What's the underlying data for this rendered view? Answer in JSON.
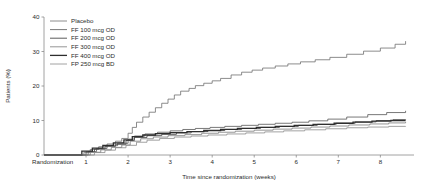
{
  "chart_data": {
    "type": "line",
    "title": "",
    "subtitle": "",
    "xlabel": "Time since randomization (weeks)",
    "ylabel": "Patients (%)",
    "xlim": [
      0,
      8.8
    ],
    "ylim": [
      0,
      40
    ],
    "grid": false,
    "legend_position": "top-left",
    "x_origin_label": "Randomization",
    "xticks": [
      1,
      2,
      3,
      4,
      5,
      6,
      7,
      8
    ],
    "xtick_labels": [
      "1",
      "2",
      "3",
      "4",
      "5",
      "6",
      "7",
      "8"
    ],
    "yticks": [
      0,
      10,
      20,
      30,
      40
    ],
    "ytick_labels": [
      "0",
      "10",
      "20",
      "30",
      "40"
    ],
    "step_type": "post",
    "series": [
      {
        "name": "Placebo",
        "color": "#6e6e6e",
        "width": 0.8,
        "final_value": 33.0,
        "x": [
          0,
          0.95,
          1.1,
          1.3,
          1.5,
          1.7,
          1.85,
          2.0,
          2.1,
          2.2,
          2.35,
          2.5,
          2.65,
          2.8,
          2.95,
          3.1,
          3.25,
          3.45,
          3.6,
          3.8,
          4.0,
          4.2,
          4.45,
          4.7,
          4.95,
          5.2,
          5.5,
          5.8,
          6.1,
          6.45,
          6.8,
          7.2,
          7.6,
          8.0,
          8.35,
          8.6
        ],
        "y": [
          0,
          0.8,
          1.6,
          2.4,
          3.2,
          4.0,
          4.8,
          6.3,
          8.0,
          9.5,
          11.0,
          12.4,
          13.7,
          15.0,
          16.2,
          17.4,
          18.5,
          19.3,
          20.1,
          20.8,
          21.5,
          22.2,
          23.2,
          24.0,
          24.6,
          25.2,
          25.8,
          26.4,
          27.0,
          27.6,
          28.3,
          29.2,
          30.1,
          31.0,
          32.1,
          33.0
        ]
      },
      {
        "name": "FF 100 mcg OD",
        "color": "#555555",
        "width": 0.8,
        "final_value": 12.8,
        "x": [
          0,
          1.05,
          1.25,
          1.5,
          1.75,
          2.0,
          2.15,
          2.4,
          2.7,
          3.0,
          3.3,
          3.6,
          3.95,
          4.3,
          4.7,
          5.1,
          5.5,
          5.9,
          6.3,
          6.75,
          7.2,
          7.7,
          8.15,
          8.6
        ],
        "y": [
          0,
          1.0,
          1.9,
          2.7,
          3.4,
          4.6,
          5.5,
          6.1,
          6.6,
          7.0,
          7.4,
          7.7,
          8.0,
          8.3,
          8.6,
          8.9,
          9.2,
          9.5,
          9.9,
          10.4,
          11.0,
          11.7,
          12.3,
          12.8
        ]
      },
      {
        "name": "FF 200 mcg OD",
        "color": "#4a4a4a",
        "width": 0.9,
        "final_value": 10.3,
        "x": [
          0,
          1.0,
          1.2,
          1.45,
          1.7,
          1.95,
          2.15,
          2.45,
          2.8,
          3.15,
          3.5,
          3.9,
          4.3,
          4.7,
          5.15,
          5.6,
          6.05,
          6.5,
          6.95,
          7.4,
          7.9,
          8.3,
          8.6
        ],
        "y": [
          0,
          0.9,
          1.7,
          2.5,
          3.1,
          4.2,
          5.1,
          5.6,
          6.0,
          6.4,
          6.8,
          7.1,
          7.4,
          7.7,
          8.0,
          8.3,
          8.6,
          8.9,
          9.2,
          9.6,
          10.0,
          10.2,
          10.3
        ]
      },
      {
        "name": "FF 300 mcg OD",
        "color": "#7a7a7a",
        "width": 0.8,
        "final_value": 9.6,
        "x": [
          0,
          1.1,
          1.35,
          1.6,
          1.85,
          2.05,
          2.3,
          2.6,
          2.95,
          3.35,
          3.75,
          4.15,
          4.55,
          5.0,
          5.45,
          5.9,
          6.35,
          6.8,
          7.25,
          7.75,
          8.2,
          8.6
        ],
        "y": [
          0,
          0.8,
          1.5,
          2.2,
          2.9,
          4.0,
          4.7,
          5.2,
          5.6,
          5.9,
          6.3,
          6.6,
          6.9,
          7.2,
          7.5,
          7.8,
          8.1,
          8.4,
          8.7,
          9.0,
          9.3,
          9.6
        ]
      },
      {
        "name": "FF 400 mcg OD",
        "color": "#2e2e2e",
        "width": 1.3,
        "final_value": 10.0,
        "x": [
          0,
          0.9,
          1.15,
          1.4,
          1.65,
          1.9,
          2.1,
          2.35,
          2.65,
          3.0,
          3.4,
          3.8,
          4.2,
          4.6,
          5.05,
          5.5,
          5.95,
          6.4,
          6.9,
          7.35,
          7.8,
          8.25,
          8.6
        ],
        "y": [
          0,
          1.1,
          2.0,
          2.8,
          3.5,
          4.4,
          5.3,
          5.8,
          6.2,
          6.5,
          6.8,
          7.1,
          7.4,
          7.7,
          8.0,
          8.3,
          8.6,
          8.9,
          9.2,
          9.5,
          9.8,
          10.0,
          10.0
        ]
      },
      {
        "name": "FP 250 mcg BD",
        "color": "#8a8a8a",
        "width": 0.8,
        "final_value": 8.4,
        "x": [
          0,
          1.2,
          1.45,
          1.7,
          1.95,
          2.2,
          2.45,
          2.75,
          3.1,
          3.5,
          3.9,
          4.35,
          4.8,
          5.25,
          5.7,
          6.2,
          6.7,
          7.2,
          7.7,
          8.2,
          8.6
        ],
        "y": [
          0,
          0.7,
          1.4,
          2.1,
          2.8,
          3.7,
          4.3,
          4.8,
          5.2,
          5.5,
          5.8,
          6.1,
          6.4,
          6.7,
          7.0,
          7.3,
          7.6,
          7.9,
          8.1,
          8.3,
          8.4
        ]
      }
    ]
  },
  "axes": {
    "ylabel": "Patients (%)",
    "xlabel": "Time since randomization (weeks)",
    "origin_label": "Randomization",
    "ytick_labels": [
      "0",
      "10",
      "20",
      "30",
      "40"
    ],
    "xtick_labels": [
      "1",
      "2",
      "3",
      "4",
      "5",
      "6",
      "7",
      "8"
    ]
  },
  "legend": {
    "items": [
      {
        "label": "Placebo"
      },
      {
        "label": "FF 100 mcg OD"
      },
      {
        "label": "FF 200 mcg OD"
      },
      {
        "label": "FF 300 mcg OD"
      },
      {
        "label": "FF 400 mcg OD"
      },
      {
        "label": "FP 250 mcg BD"
      }
    ]
  }
}
